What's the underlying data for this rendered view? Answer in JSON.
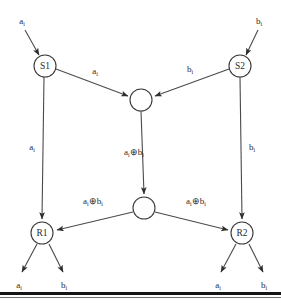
{
  "figure": {
    "kind": "network-coding-butterfly-diagram",
    "background_color": "#ffffff",
    "stroke_color": "#4a4a4a",
    "text_color": "#2b2b2b",
    "rule_color": "#151515"
  },
  "symbols": {
    "a": "a",
    "b": "b",
    "subscript": "i",
    "xor": "⊕"
  },
  "nodes": {
    "s1": {
      "label": "S1",
      "cx": 45,
      "cy": 66,
      "r": 11
    },
    "s2": {
      "label": "S2",
      "cx": 240,
      "cy": 66,
      "r": 11
    },
    "relay_top": {
      "label": "",
      "cx": 141,
      "cy": 100,
      "r": 11
    },
    "relay_bottom": {
      "label": "",
      "cx": 144,
      "cy": 208,
      "r": 11
    },
    "r1": {
      "label": "R1",
      "cx": 42,
      "cy": 233,
      "r": 11
    },
    "r2": {
      "label": "R2",
      "cx": 242,
      "cy": 233,
      "r": 11
    }
  },
  "edge_labels": {
    "s1_to_relay": {
      "base": "a",
      "sub": "i",
      "x": 95,
      "y": 74
    },
    "s2_to_relay": {
      "base": "b",
      "sub": "i",
      "x": 190,
      "y": 72
    },
    "s1_to_r1": {
      "base": "a",
      "sub": "i",
      "x": 32,
      "y": 150
    },
    "s2_to_r2": {
      "base": "b",
      "sub": "i",
      "x": 252,
      "y": 150
    },
    "relay_top_to_relay_bottom": {
      "a": "a",
      "a_sub": "i",
      "op": "⊕",
      "b": "b",
      "b_sub": "i",
      "x": 134,
      "y": 155
    },
    "relay_bottom_to_r1": {
      "a": "a",
      "a_sub": "i",
      "op": "⊕",
      "b": "b",
      "b_sub": "i",
      "x": 93,
      "y": 204
    },
    "relay_bottom_to_r2": {
      "a": "a",
      "a_sub": "i",
      "op": "⊕",
      "b": "b",
      "b_sub": "i",
      "x": 196,
      "y": 204
    }
  },
  "io_labels": {
    "s1_input": {
      "base": "a",
      "sub": "i",
      "x": 22,
      "y": 24
    },
    "s2_input": {
      "base": "b",
      "sub": "i",
      "x": 259,
      "y": 24
    },
    "r1_output_a": {
      "base": "a",
      "sub": "i",
      "x": 19,
      "y": 288
    },
    "r1_output_b": {
      "base": "b",
      "sub": "i",
      "x": 64,
      "y": 288
    },
    "r2_output_a": {
      "base": "a",
      "sub": "i",
      "x": 218,
      "y": 288
    },
    "r2_output_b": {
      "base": "b",
      "sub": "i",
      "x": 264,
      "y": 288
    }
  },
  "edges": [
    {
      "name": "input-to-s1",
      "from": "external-a",
      "to": "S1",
      "label": "a_i"
    },
    {
      "name": "input-to-s2",
      "from": "external-b",
      "to": "S2",
      "label": "b_i"
    },
    {
      "name": "s1-to-relay-top",
      "from": "S1",
      "to": "relay-top",
      "label": "a_i"
    },
    {
      "name": "s2-to-relay-top",
      "from": "S2",
      "to": "relay-top",
      "label": "b_i"
    },
    {
      "name": "s1-to-r1",
      "from": "S1",
      "to": "R1",
      "label": "a_i"
    },
    {
      "name": "s2-to-r2",
      "from": "S2",
      "to": "R2",
      "label": "b_i"
    },
    {
      "name": "relay-top-to-relay-bottom",
      "from": "relay-top",
      "to": "relay-bottom",
      "label": "a_i XOR b_i"
    },
    {
      "name": "relay-bottom-to-r1",
      "from": "relay-bottom",
      "to": "R1",
      "label": "a_i XOR b_i"
    },
    {
      "name": "relay-bottom-to-r2",
      "from": "relay-bottom",
      "to": "R2",
      "label": "a_i XOR b_i"
    },
    {
      "name": "r1-output-a",
      "from": "R1",
      "to": "external",
      "label": "a_i"
    },
    {
      "name": "r1-output-b",
      "from": "R1",
      "to": "external",
      "label": "b_i"
    },
    {
      "name": "r2-output-a",
      "from": "R2",
      "to": "external",
      "label": "a_i"
    },
    {
      "name": "r2-output-b",
      "from": "R2",
      "to": "external",
      "label": "b_i"
    }
  ]
}
